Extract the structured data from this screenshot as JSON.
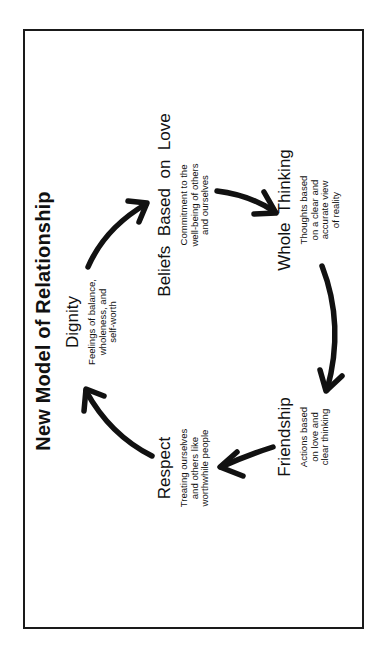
{
  "diagram": {
    "title": "New Model of Relationship",
    "orientation": "rotated 90° counter-clockwise",
    "nodes": [
      {
        "heading": "Dignity",
        "description": "Feelings of balance,\nwholeness, and\nself-worth"
      },
      {
        "heading": "Beliefs  Based  on  Love",
        "description": "Commitment to the\nwell-being of others\nand ourselves"
      },
      {
        "heading": "Whole  Thinking",
        "description": "Thoughts based\non a clear and\naccurate view\nof reality"
      },
      {
        "heading": "Friendship",
        "description": "Actions based\non love and\nclear thinking"
      },
      {
        "heading": "Respect",
        "description": "Treating ourselves\nand others like\nworthwhile people"
      }
    ],
    "edges": [
      {
        "from": "Dignity",
        "to": "Beliefs Based on Love"
      },
      {
        "from": "Beliefs Based on Love",
        "to": "Whole Thinking"
      },
      {
        "from": "Whole Thinking",
        "to": "Friendship"
      },
      {
        "from": "Friendship",
        "to": "Respect"
      },
      {
        "from": "Respect",
        "to": "Dignity"
      }
    ],
    "colors": {
      "ink": "#111111",
      "background": "#ffffff",
      "border": "#1a1a1a"
    }
  }
}
